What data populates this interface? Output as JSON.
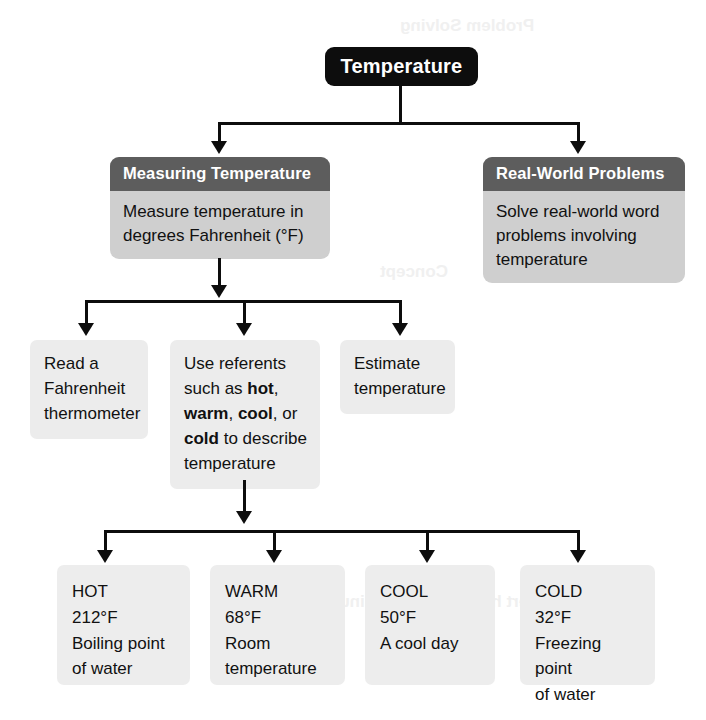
{
  "diagram": {
    "title": "Temperature",
    "root": {
      "label": "Temperature"
    },
    "level2": [
      {
        "header": "Measuring Temperature",
        "body_line1": "Measure temperature in",
        "body_line2": "degrees Fahrenheit (°F)"
      },
      {
        "header": "Real-World Problems",
        "body_line1": "Solve real-world word",
        "body_line2": "problems involving",
        "body_line3": "temperature"
      }
    ],
    "level3": [
      {
        "text": "Read a Fahrenheit thermometer"
      },
      {
        "text_parts": [
          {
            "t": "Use referents such as ",
            "bold": false
          },
          {
            "t": "hot",
            "bold": true
          },
          {
            "t": ", ",
            "bold": false
          },
          {
            "t": "warm",
            "bold": true
          },
          {
            "t": ", ",
            "bold": false
          },
          {
            "t": "cool",
            "bold": true
          },
          {
            "t": ", or ",
            "bold": false
          },
          {
            "t": "cold",
            "bold": true
          },
          {
            "t": " to describe temperature",
            "bold": false
          }
        ]
      },
      {
        "text": "Estimate temperature"
      }
    ],
    "level4": [
      {
        "label": "HOT",
        "value": "212°F",
        "desc_line1": "Boiling point",
        "desc_line2": "of water"
      },
      {
        "label": "WARM",
        "value": "68°F",
        "desc_line1": "Room",
        "desc_line2": "temperature"
      },
      {
        "label": "COOL",
        "value": "50°F",
        "desc_line1": "A cool day",
        "desc_line2": ""
      },
      {
        "label": "COLD",
        "value": "32°F",
        "desc_line1": "Freezing point",
        "desc_line2": "of water"
      }
    ]
  },
  "colors": {
    "root_bg": "#0d0d0d",
    "header_bg": "#5d5d5d",
    "body_bg": "#cfcfcf",
    "leaf_bg": "#ededed",
    "connector": "#0d0d0d",
    "text_dark": "#111111",
    "text_light": "#ffffff"
  },
  "ghosts": {
    "a": "Problem Solving",
    "b": "Concept",
    "c": "minutes to minutes.",
    "d": "nvert hours an"
  }
}
